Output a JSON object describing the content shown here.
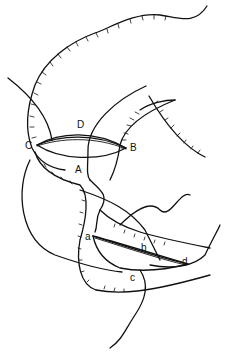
{
  "figure": {
    "type": "surgical line drawing",
    "labels": {
      "upper": {
        "A": "A",
        "B": "B",
        "C": "C",
        "D": "D"
      },
      "lower": {
        "a": "a",
        "b": "b",
        "c": "c",
        "d": "d"
      }
    },
    "colors": {
      "line": "#111111",
      "fill_stipple": "#bdbdbd",
      "background": "#ffffff"
    }
  }
}
